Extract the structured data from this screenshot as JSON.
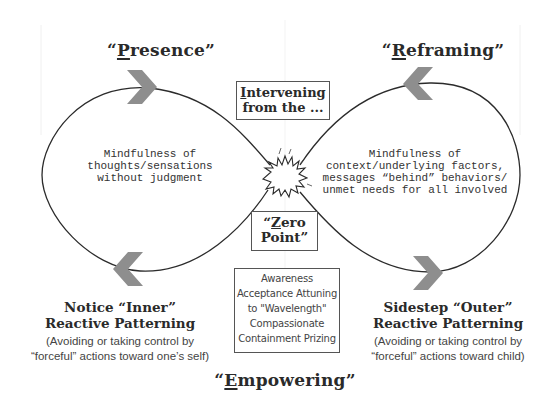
{
  "diagram": {
    "quadrants": {
      "top_left": {
        "label_prefix": "“",
        "label_initial": "P",
        "label_rest": "resence”",
        "full_label": "“Presence”"
      },
      "top_right": {
        "label_prefix": "“",
        "label_initial": "R",
        "label_rest": "eframing”",
        "full_label": "“Reframing”"
      },
      "bottom": {
        "label_prefix": "“",
        "label_initial": "E",
        "label_rest": "mpowering”",
        "full_label": "“Empowering”"
      }
    },
    "center_box_top": {
      "line1_initial": "I",
      "line1_rest": "ntervening",
      "line2": "from the ..."
    },
    "center_box_zero": {
      "line1_prefix": "“",
      "line1_initial": "Z",
      "line1_rest": "ero",
      "line2": "Point”"
    },
    "left_loop_text": [
      "Mindfulness of",
      "thoughts/sensations",
      "without judgment"
    ],
    "right_loop_text": [
      "Mindfulness of",
      "context/underlying factors,",
      "messages “behind” behaviors/",
      "unmet needs for all involved"
    ],
    "qualities_box": [
      "Awareness",
      "Acceptance Attuning",
      "to \"Wavelength\"",
      "Compassionate",
      "Containment Prizing"
    ],
    "left_pattern": {
      "title_line1": "Notice “Inner”",
      "title_line2": "Reactive Patterning",
      "sub_line1": "(Avoiding or taking control by",
      "sub_line2": "“forceful” actions toward one’s self)"
    },
    "right_pattern": {
      "title_line1": "Sidestep “Outer”",
      "title_line2": "Reactive Patterning",
      "sub_line1": "(Avoiding or taking control by",
      "sub_line2": "“forceful” actions toward child)"
    },
    "arrows": [
      {
        "position": "top-left",
        "direction": "right"
      },
      {
        "position": "top-right",
        "direction": "left"
      },
      {
        "position": "bottom-left",
        "direction": "left"
      },
      {
        "position": "bottom-right",
        "direction": "right"
      }
    ],
    "center_icon": "starburst-icon",
    "colors": {
      "line": "#2b2b2b",
      "arrow": "#8e8e8e",
      "text": "#2a2a2a",
      "box_border": "#555555",
      "background": "#ffffff"
    }
  }
}
